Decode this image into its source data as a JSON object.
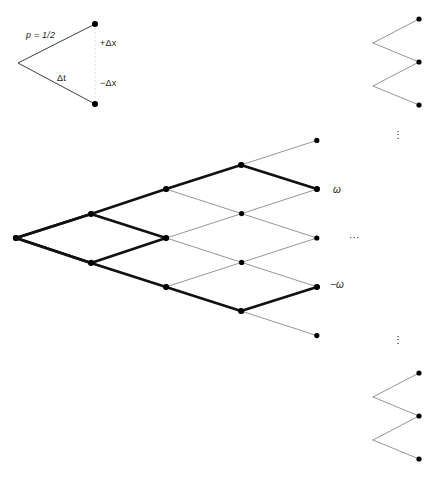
{
  "figure": {
    "type": "binomial-lattice",
    "colors": {
      "lattice_line": "#8a8a8a",
      "bold_path": "#111111",
      "node": "#000000",
      "legend_line": "#4a4a4a",
      "guide_line": "#c8c8c8"
    },
    "geometry": {
      "origin_x": 16,
      "origin_y": 238,
      "col_step": 75.2,
      "row_step": 24.4,
      "node_radius": 2.6,
      "columns": 5,
      "rows_half": 9
    }
  },
  "legend": {
    "probability_label": "p = 1/2",
    "up_step_label": "+Δx",
    "time_step_label": "Δt",
    "down_step_label": "−Δx",
    "vertex_x": 18,
    "vertex_y": 63,
    "up_node_x": 95,
    "up_node_y": 24,
    "down_node_x": 95,
    "down_node_y": 104
  },
  "annotations": {
    "omega_label": "ω",
    "omega_x": 333,
    "omega_y": 184,
    "neg_omega_label": "−ω",
    "neg_omega_x": 330,
    "neg_omega_y": 279,
    "horizontal_ellipsis": "···",
    "h_ellipsis_x": 349,
    "h_ellipsis_y": 232,
    "vertical_ellipsis_top": "⋮",
    "v_ellipsis_top_x": 393,
    "v_ellipsis_top_y": 129,
    "vertical_ellipsis_bottom": "⋮",
    "v_ellipsis_bottom_x": 393,
    "v_ellipsis_bottom_y": 334
  },
  "chart_data": {
    "type": "scatter",
    "title": "",
    "xlabel": "",
    "ylabel": "",
    "lattice_nodes": [
      {
        "col": 0,
        "k": 0,
        "x": 16,
        "y": 238
      },
      {
        "col": 1,
        "k": -1,
        "x": 91,
        "y": 214
      },
      {
        "col": 1,
        "k": 1,
        "x": 91,
        "y": 263
      },
      {
        "col": 2,
        "k": -2,
        "x": 166,
        "y": 189
      },
      {
        "col": 2,
        "k": 0,
        "x": 166,
        "y": 238
      },
      {
        "col": 2,
        "k": 2,
        "x": 166,
        "y": 287
      },
      {
        "col": 3,
        "k": -3,
        "x": 241,
        "y": 165
      },
      {
        "col": 3,
        "k": -1,
        "x": 241,
        "y": 214
      },
      {
        "col": 3,
        "k": 1,
        "x": 241,
        "y": 263
      },
      {
        "col": 3,
        "k": 3,
        "x": 241,
        "y": 311
      },
      {
        "col": 4,
        "k": -4,
        "x": 317,
        "y": 141
      },
      {
        "col": 4,
        "k": -2,
        "x": 317,
        "y": 189
      },
      {
        "col": 4,
        "k": 0,
        "x": 317,
        "y": 238
      },
      {
        "col": 4,
        "k": 2,
        "x": 317,
        "y": 287
      },
      {
        "col": 4,
        "k": 4,
        "x": 317,
        "y": 335
      }
    ],
    "highlighted_paths": [
      {
        "name": "path-to-omega",
        "endpoint_label": "ω",
        "points": [
          [
            16,
            238
          ],
          [
            91,
            214
          ],
          [
            166,
            189
          ],
          [
            241,
            165
          ],
          [
            317,
            189
          ]
        ]
      },
      {
        "name": "path-to-negative-omega",
        "endpoint_label": "−ω",
        "points": [
          [
            16,
            238
          ],
          [
            91,
            263
          ],
          [
            166,
            287
          ],
          [
            241,
            311
          ],
          [
            317,
            287
          ]
        ]
      }
    ]
  }
}
